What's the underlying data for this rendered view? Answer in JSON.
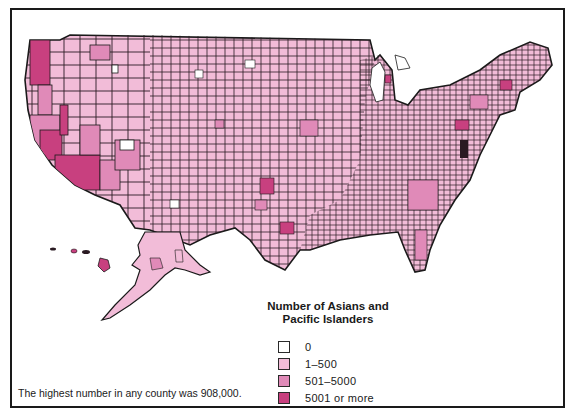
{
  "map": {
    "title": "Number of Asians and Pacific Islanders by County",
    "region": "United States (counties, incl. Alaska and Hawaii)"
  },
  "legend": {
    "title_line1": "Number of Asians and",
    "title_line2": "Pacific Islanders",
    "items": [
      {
        "label": "0",
        "color": "#ffffff"
      },
      {
        "label": "1–500",
        "color": "#f2bcd8"
      },
      {
        "label": "501–5000",
        "color": "#e08ab8"
      },
      {
        "label": "5001 or more",
        "color": "#c8407f"
      }
    ]
  },
  "footnote": "The highest number in any county was 908,000.",
  "colors": {
    "border": "#1a1a1a",
    "class_0": "#ffffff",
    "class_1": "#f2bcd8",
    "class_2": "#e08ab8",
    "class_3": "#c8407f"
  }
}
